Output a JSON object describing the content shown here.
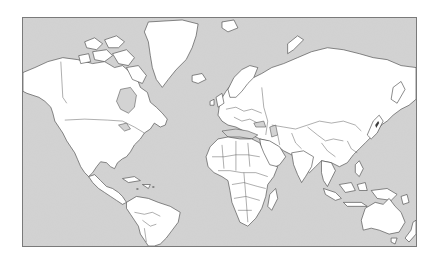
{
  "map": {
    "title": "World political outline map",
    "projection": "Mercator",
    "labels_visible": false,
    "colors": {
      "ocean": "#d3d3d3",
      "land": "#ffffff",
      "border": "#3c3c3c",
      "frame": "#7a7a7a",
      "page_background": "#ffffff"
    },
    "regions": [
      "north-america",
      "greenland",
      "canadian-arctic-archipelago",
      "central-america",
      "caribbean",
      "south-america",
      "iceland",
      "europe",
      "africa",
      "madagascar",
      "middle-east",
      "russia",
      "central-asia",
      "south-asia",
      "east-asia",
      "japan",
      "southeast-asia",
      "indonesia",
      "papua-new-guinea",
      "australia",
      "tasmania",
      "new-zealand",
      "svalbard",
      "novaya-zemlya"
    ]
  }
}
